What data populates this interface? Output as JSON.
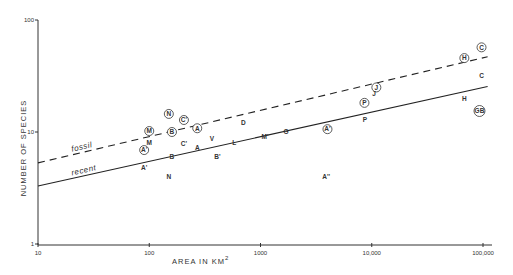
{
  "chart_data": {
    "type": "scatter",
    "title": "",
    "xlabel": "AREA IN KM",
    "xlabel_superscript": "2",
    "ylabel": "NUMBER OF SPECIES",
    "xscale": "log",
    "yscale": "log",
    "xlim": [
      10,
      100000
    ],
    "ylim": [
      1,
      100
    ],
    "grid": false,
    "x_ticks": [
      "10",
      "100",
      "1000",
      "10,000",
      "100,000"
    ],
    "y_ticks": [
      "1",
      "10",
      "100"
    ],
    "series": [
      {
        "name": "fossil",
        "marker": "circled letter",
        "points": [
          {
            "label": "M",
            "area": 100,
            "species": 10.2
          },
          {
            "label": "A'",
            "area": 90,
            "species": 6.9
          },
          {
            "label": "N",
            "area": 150,
            "species": 14.5
          },
          {
            "label": "B",
            "area": 160,
            "species": 10
          },
          {
            "label": "C'",
            "area": 205,
            "species": 12.8
          },
          {
            "label": "A",
            "area": 270,
            "species": 10.8
          },
          {
            "label": "A'",
            "area": 4000,
            "species": 10.6
          },
          {
            "label": "P",
            "area": 8600,
            "species": 18.2
          },
          {
            "label": "J",
            "area": 11000,
            "species": 25
          },
          {
            "label": "H",
            "area": 68000,
            "species": 45.7
          },
          {
            "label": "C",
            "area": 97000,
            "species": 57
          },
          {
            "label": "GB",
            "area": 93000,
            "species": 15.4
          }
        ],
        "fit_line": {
          "label": "fossil",
          "style": "dashed",
          "start": {
            "area": 10,
            "species": 5.3
          },
          "end": {
            "area": 110000,
            "species": 47
          }
        }
      },
      {
        "name": "recent",
        "marker": "letter",
        "points": [
          {
            "label": "M",
            "area": 100,
            "species": 8.1
          },
          {
            "label": "A'",
            "area": 90,
            "species": 4.8
          },
          {
            "label": "B",
            "area": 160,
            "species": 6
          },
          {
            "label": "N",
            "area": 150,
            "species": 4.0
          },
          {
            "label": "C'",
            "area": 205,
            "species": 7.8
          },
          {
            "label": "A",
            "area": 270,
            "species": 7.2
          },
          {
            "label": "V",
            "area": 365,
            "species": 8.8
          },
          {
            "label": "B'",
            "area": 410,
            "species": 6
          },
          {
            "label": "D",
            "area": 700,
            "species": 12
          },
          {
            "label": "L",
            "area": 580,
            "species": 8
          },
          {
            "label": "M'",
            "area": 1100,
            "species": 9
          },
          {
            "label": "G",
            "area": 1700,
            "species": 10
          },
          {
            "label": "A''",
            "area": 3900,
            "species": 4
          },
          {
            "label": "P",
            "area": 8700,
            "species": 12.8
          },
          {
            "label": "J",
            "area": 10500,
            "species": 22
          },
          {
            "label": "H",
            "area": 68000,
            "species": 20
          },
          {
            "label": "C",
            "area": 97000,
            "species": 31.6
          }
        ],
        "fit_line": {
          "label": "recent",
          "style": "solid",
          "start": {
            "area": 10,
            "species": 3.3
          },
          "end": {
            "area": 110000,
            "species": 25.5
          }
        }
      }
    ]
  }
}
